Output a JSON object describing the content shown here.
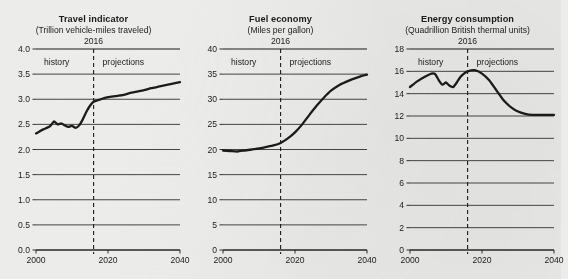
{
  "page": {
    "background_color": "#ececeb",
    "ink_color": "#1b1b1b",
    "divider_year_label": "2016",
    "history_label": "history",
    "projections_label": "projections"
  },
  "chart_data": [
    {
      "type": "line",
      "title": "Travel indicator",
      "subtitle": "(Trillion vehicle-miles traveled)",
      "xlabel": "",
      "ylabel": "",
      "xlim": [
        2000,
        2040
      ],
      "ylim": [
        0.0,
        4.0
      ],
      "yticks": [
        "0.0",
        "0.5",
        "1.0",
        "1.5",
        "2.0",
        "2.5",
        "3.0",
        "3.5",
        "4.0"
      ],
      "ytick_values": [
        0.0,
        0.5,
        1.0,
        1.5,
        2.0,
        2.5,
        3.0,
        3.5,
        4.0
      ],
      "xticks": [
        "2000",
        "2020",
        "2040"
      ],
      "xtick_values": [
        2000,
        2020,
        2040
      ],
      "grid": true,
      "divider_x": 2016,
      "annotations": [
        "2016",
        "history",
        "projections"
      ],
      "x": [
        2000,
        2001,
        2002,
        2003,
        2004,
        2005,
        2006,
        2007,
        2008,
        2009,
        2010,
        2011,
        2012,
        2013,
        2014,
        2015,
        2016,
        2018,
        2020,
        2022,
        2024,
        2026,
        2028,
        2030,
        2032,
        2034,
        2036,
        2038,
        2040
      ],
      "values": [
        2.32,
        2.36,
        2.4,
        2.43,
        2.47,
        2.56,
        2.5,
        2.52,
        2.48,
        2.45,
        2.47,
        2.43,
        2.48,
        2.6,
        2.75,
        2.87,
        2.95,
        3.0,
        3.04,
        3.06,
        3.08,
        3.12,
        3.15,
        3.18,
        3.22,
        3.25,
        3.28,
        3.31,
        3.34
      ]
    },
    {
      "type": "line",
      "title": "Fuel economy",
      "subtitle": "(Miles per gallon)",
      "xlabel": "",
      "ylabel": "",
      "xlim": [
        2000,
        2040
      ],
      "ylim": [
        0,
        40
      ],
      "yticks": [
        "0",
        "5",
        "10",
        "15",
        "20",
        "25",
        "30",
        "35",
        "40"
      ],
      "ytick_values": [
        0,
        5,
        10,
        15,
        20,
        25,
        30,
        35,
        40
      ],
      "xticks": [
        "2000",
        "2020",
        "2040"
      ],
      "xtick_values": [
        2000,
        2020,
        2040
      ],
      "grid": true,
      "divider_x": 2016,
      "annotations": [
        "2016",
        "history",
        "projections"
      ],
      "x": [
        2000,
        2002,
        2004,
        2006,
        2008,
        2010,
        2012,
        2014,
        2016,
        2018,
        2020,
        2022,
        2024,
        2026,
        2028,
        2030,
        2032,
        2034,
        2036,
        2038,
        2040
      ],
      "values": [
        19.8,
        19.7,
        19.6,
        19.8,
        20.0,
        20.2,
        20.5,
        20.8,
        21.3,
        22.2,
        23.4,
        25.0,
        26.9,
        28.7,
        30.3,
        31.7,
        32.7,
        33.4,
        34.0,
        34.5,
        34.9
      ]
    },
    {
      "type": "line",
      "title": "Energy consumption",
      "subtitle": "(Quadrillion British thermal units)",
      "xlabel": "",
      "ylabel": "",
      "xlim": [
        2000,
        2040
      ],
      "ylim": [
        0,
        18
      ],
      "yticks": [
        "0",
        "2",
        "4",
        "6",
        "8",
        "10",
        "12",
        "14",
        "16",
        "18"
      ],
      "ytick_values": [
        0,
        2,
        4,
        6,
        8,
        10,
        12,
        14,
        16,
        18
      ],
      "xticks": [
        "2000",
        "2020",
        "2040"
      ],
      "xtick_values": [
        2000,
        2020,
        2040
      ],
      "grid": true,
      "divider_x": 2016,
      "annotations": [
        "2016",
        "history",
        "projections"
      ],
      "x": [
        2000,
        2002,
        2004,
        2006,
        2007,
        2008,
        2009,
        2010,
        2011,
        2012,
        2013,
        2014,
        2015,
        2016,
        2018,
        2020,
        2022,
        2024,
        2026,
        2028,
        2030,
        2032,
        2034,
        2036,
        2038,
        2040
      ],
      "values": [
        14.6,
        15.1,
        15.5,
        15.8,
        15.75,
        15.2,
        14.8,
        15.0,
        14.7,
        14.6,
        15.0,
        15.5,
        15.8,
        16.0,
        16.1,
        15.8,
        15.2,
        14.3,
        13.4,
        12.8,
        12.4,
        12.2,
        12.1,
        12.1,
        12.1,
        12.1
      ]
    }
  ]
}
